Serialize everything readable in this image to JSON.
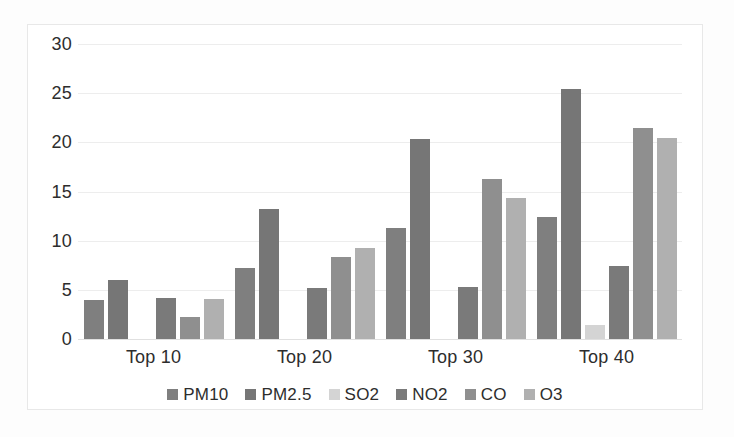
{
  "chart_data": {
    "type": "bar",
    "title": "",
    "subtitle": "",
    "xlabel": "",
    "ylabel": "",
    "categories": [
      "Top 10",
      "Top 20",
      "Top 30",
      "Top 40"
    ],
    "ylim": [
      0,
      30
    ],
    "yticks": [
      0,
      5,
      10,
      15,
      20,
      25,
      30
    ],
    "ytick_labels": [
      "0",
      "5",
      "10",
      "15",
      "20",
      "25",
      "30"
    ],
    "grid": true,
    "grid_axis": "y",
    "legend_position": "bottom",
    "series": [
      {
        "name": "PM10",
        "color": "#7f7f7f",
        "values": [
          4.0,
          7.2,
          11.3,
          12.4
        ]
      },
      {
        "name": "PM2.5",
        "color": "#767676",
        "values": [
          6.0,
          13.2,
          20.3,
          25.4
        ]
      },
      {
        "name": "SO2",
        "color": "#d4d4d4",
        "values": [
          0,
          0,
          0,
          1.4
        ]
      },
      {
        "name": "NO2",
        "color": "#7a7a7a",
        "values": [
          4.2,
          5.2,
          5.3,
          7.4
        ]
      },
      {
        "name": "CO",
        "color": "#8f8f8f",
        "values": [
          2.2,
          8.3,
          16.3,
          21.5
        ]
      },
      {
        "name": "O3",
        "color": "#b0b0b0",
        "values": [
          4.1,
          9.3,
          14.3,
          20.4
        ]
      }
    ]
  },
  "legend": {
    "items": [
      {
        "label": "PM10"
      },
      {
        "label": "PM2.5"
      },
      {
        "label": "SO2"
      },
      {
        "label": "NO2"
      },
      {
        "label": "CO"
      },
      {
        "label": "O3"
      }
    ]
  }
}
